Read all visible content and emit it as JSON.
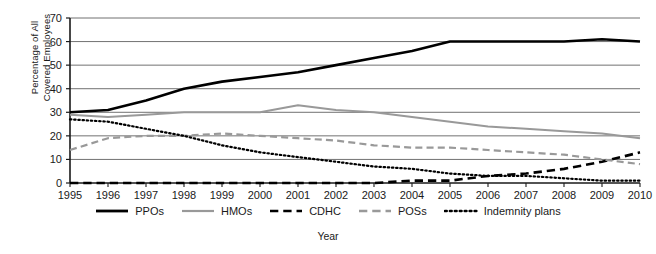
{
  "chart_data": {
    "type": "line",
    "title": "",
    "xlabel": "Year",
    "ylabel": "Percentage of All Covered Employees",
    "ylabel_line1": "Percentage of All",
    "ylabel_line2": "Covered Employees",
    "grid": true,
    "legend_position": "bottom",
    "xlim": [
      1995,
      2010
    ],
    "ylim": [
      0,
      70
    ],
    "yticks": [
      0,
      10,
      20,
      30,
      40,
      50,
      60,
      70
    ],
    "categories": [
      1995,
      1996,
      1997,
      1998,
      1999,
      2000,
      2001,
      2002,
      2003,
      2004,
      2005,
      2006,
      2007,
      2008,
      2009,
      2010
    ],
    "x": [
      "1995",
      "1996",
      "1997",
      "1998",
      "1999",
      "2000",
      "2001",
      "2002",
      "2003",
      "2004",
      "2005",
      "2006",
      "2007",
      "2008",
      "2009",
      "2010"
    ],
    "series": [
      {
        "name": "PPOs",
        "style": "solid",
        "color": "#000000",
        "width": 2.6,
        "values": [
          30,
          31,
          35,
          40,
          43,
          45,
          47,
          50,
          53,
          56,
          60,
          60,
          60,
          60,
          61,
          60
        ]
      },
      {
        "name": "HMOs",
        "style": "solid",
        "color": "#999999",
        "width": 2.0,
        "values": [
          29,
          28,
          29,
          30,
          30,
          30,
          33,
          31,
          30,
          28,
          26,
          24,
          23,
          22,
          21,
          19
        ]
      },
      {
        "name": "CDHC",
        "style": "dashed",
        "color": "#000000",
        "width": 2.6,
        "values": [
          0,
          0,
          0,
          0,
          0,
          0,
          0,
          0,
          0,
          1,
          1,
          3,
          4,
          6,
          9,
          13
        ]
      },
      {
        "name": "POSs",
        "style": "dashed",
        "color": "#999999",
        "width": 2.2,
        "values": [
          14,
          19,
          20,
          20,
          21,
          20,
          19,
          18,
          16,
          15,
          15,
          14,
          13,
          12,
          10,
          8
        ]
      },
      {
        "name": "Indemnity plans",
        "style": "dotted",
        "color": "#000000",
        "width": 2.2,
        "values": [
          27,
          26,
          23,
          20,
          16,
          13,
          11,
          9,
          7,
          6,
          4,
          3,
          3,
          2,
          1,
          1
        ]
      }
    ]
  },
  "axis": {
    "y_tick_labels": [
      "0",
      "10",
      "20",
      "30",
      "40",
      "50",
      "60",
      "70"
    ],
    "x_tick_labels": [
      "1995",
      "1996",
      "1997",
      "1998",
      "1999",
      "2000",
      "2001",
      "2002",
      "2003",
      "2004",
      "2005",
      "2006",
      "2007",
      "2008",
      "2009",
      "2010"
    ],
    "x_title": "Year",
    "y_title_line1": "Percentage of All",
    "y_title_line2": "Covered Employees"
  },
  "legend": {
    "items": [
      {
        "label": "PPOs",
        "style": "solid",
        "color": "#000000"
      },
      {
        "label": "HMOs",
        "style": "solid",
        "color": "#999999"
      },
      {
        "label": "CDHC",
        "style": "dashed",
        "color": "#000000"
      },
      {
        "label": "POSs",
        "style": "dashed",
        "color": "#999999"
      },
      {
        "label": "Indemnity plans",
        "style": "dotted",
        "color": "#000000"
      }
    ]
  }
}
